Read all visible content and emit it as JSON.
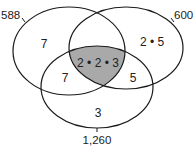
{
  "diagram": {
    "type": "venn-3",
    "sets": [
      {
        "id": "A",
        "label": "588",
        "color": "#1a1a1a"
      },
      {
        "id": "B",
        "label": "600",
        "color": "#1a1a1a"
      },
      {
        "id": "C",
        "label": "1,260",
        "color": "#1a1a1a"
      }
    ],
    "regions": {
      "A_only": "7",
      "B_only": "2 • 5",
      "C_only": "3",
      "A_and_C": "7",
      "B_and_C": "5",
      "A_B_C": "2 • 2 • 3"
    },
    "highlight_region": "A_B_C",
    "highlight_color": "#a9a9a9"
  }
}
